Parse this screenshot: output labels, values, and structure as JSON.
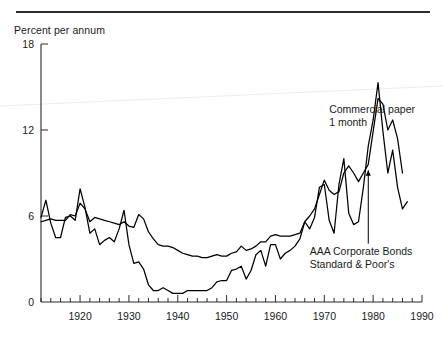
{
  "figure": {
    "y_axis_title": "Percent per annum",
    "top_rule": true
  },
  "chart_data": {
    "type": "line",
    "title": "Percent per annum",
    "xlabel": "",
    "ylabel": "Percent per annum",
    "xlim": [
      1912,
      1990
    ],
    "ylim": [
      0,
      18
    ],
    "grid": false,
    "legend_position": "inline-annotations",
    "y_ticks": [
      0,
      6,
      12,
      18
    ],
    "y_tick_labels": [
      "0",
      "6",
      "12",
      "18"
    ],
    "x_ticks": [
      1920,
      1930,
      1940,
      1950,
      1960,
      1970,
      1980,
      1990
    ],
    "x_tick_labels": [
      "1920",
      "1930",
      "1940",
      "1950",
      "1960",
      "1970",
      "1980",
      "1990"
    ],
    "x_minor_tick_interval": 2,
    "annotations": [
      {
        "name": "commercial-paper-label",
        "line1": "Commercial paper",
        "line2": "1 month",
        "x": 1971,
        "y": 13.2
      },
      {
        "name": "aaa-bonds-label",
        "line1": "AAA Corporate Bonds",
        "line2": "Standard & Poor's",
        "x": 1967,
        "y": 3.3,
        "has_leader_line": true,
        "leader_target_x": 1979,
        "leader_target_y": 9.2
      }
    ],
    "series": [
      {
        "name": "Commercial paper 1 month",
        "color": "#000000",
        "x": [
          1912,
          1913,
          1914,
          1915,
          1916,
          1917,
          1918,
          1919,
          1920,
          1921,
          1922,
          1923,
          1924,
          1925,
          1926,
          1927,
          1928,
          1929,
          1930,
          1931,
          1932,
          1933,
          1934,
          1935,
          1936,
          1937,
          1938,
          1939,
          1940,
          1941,
          1942,
          1943,
          1944,
          1945,
          1946,
          1947,
          1948,
          1949,
          1950,
          1951,
          1952,
          1953,
          1954,
          1955,
          1956,
          1957,
          1958,
          1959,
          1960,
          1961,
          1962,
          1963,
          1964,
          1965,
          1966,
          1967,
          1968,
          1969,
          1970,
          1971,
          1972,
          1973,
          1974,
          1975,
          1976,
          1977,
          1978,
          1979,
          1980,
          1981,
          1982,
          1983,
          1984,
          1985,
          1986,
          1987
        ],
        "y": [
          5.9,
          7.1,
          5.5,
          4.5,
          4.5,
          5.9,
          6.0,
          5.7,
          7.9,
          6.6,
          4.8,
          5.1,
          4.0,
          4.3,
          4.5,
          4.2,
          5.1,
          6.4,
          4.0,
          2.7,
          2.8,
          2.3,
          1.2,
          0.8,
          0.8,
          1.0,
          0.8,
          0.6,
          0.6,
          0.6,
          0.8,
          0.8,
          0.8,
          0.8,
          0.8,
          1.0,
          1.4,
          1.5,
          1.5,
          2.2,
          2.3,
          2.5,
          1.6,
          2.2,
          3.3,
          3.6,
          2.5,
          4.0,
          4.0,
          3.0,
          3.4,
          3.6,
          3.9,
          4.4,
          5.6,
          5.1,
          5.9,
          8.0,
          8.2,
          5.7,
          4.8,
          8.2,
          10.0,
          6.2,
          5.4,
          5.6,
          8.0,
          10.9,
          12.7,
          15.3,
          11.9,
          9.0,
          10.6,
          8.0,
          6.5,
          7.0
        ]
      },
      {
        "name": "AAA Corporate Bonds Standard & Poor's",
        "color": "#000000",
        "x": [
          1912,
          1913,
          1914,
          1915,
          1916,
          1917,
          1918,
          1919,
          1920,
          1921,
          1922,
          1923,
          1924,
          1925,
          1926,
          1927,
          1928,
          1929,
          1930,
          1931,
          1932,
          1933,
          1934,
          1935,
          1936,
          1937,
          1938,
          1939,
          1940,
          1941,
          1942,
          1943,
          1944,
          1945,
          1946,
          1947,
          1948,
          1949,
          1950,
          1951,
          1952,
          1953,
          1954,
          1955,
          1956,
          1957,
          1958,
          1959,
          1960,
          1961,
          1962,
          1963,
          1964,
          1965,
          1966,
          1967,
          1968,
          1969,
          1970,
          1971,
          1972,
          1973,
          1974,
          1975,
          1976,
          1977,
          1978,
          1979,
          1980,
          1981,
          1982,
          1983,
          1984,
          1985,
          1986
        ],
        "y": [
          5.6,
          5.7,
          5.8,
          5.7,
          5.7,
          5.7,
          6.1,
          6.0,
          6.9,
          6.5,
          5.6,
          5.9,
          5.8,
          5.7,
          5.6,
          5.5,
          5.4,
          5.6,
          5.3,
          5.2,
          6.1,
          5.8,
          4.9,
          4.4,
          4.0,
          3.9,
          3.9,
          3.8,
          3.6,
          3.4,
          3.3,
          3.2,
          3.2,
          3.1,
          3.1,
          3.2,
          3.3,
          3.2,
          3.2,
          3.4,
          3.5,
          3.9,
          3.6,
          3.7,
          3.9,
          4.2,
          4.2,
          4.6,
          4.7,
          4.6,
          4.6,
          4.6,
          4.7,
          4.8,
          5.6,
          6.0,
          6.5,
          7.5,
          8.5,
          7.8,
          7.5,
          7.7,
          9.0,
          9.5,
          9.0,
          8.4,
          9.0,
          9.6,
          11.9,
          14.2,
          13.8,
          12.0,
          12.7,
          11.4,
          9.0
        ]
      }
    ]
  }
}
